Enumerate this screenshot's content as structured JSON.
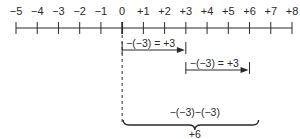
{
  "number_line": {
    "min": -5,
    "max": 8,
    "tick_labels": [
      "−5",
      "−4",
      "−3",
      "−2",
      "−1",
      "0",
      "+1",
      "+2",
      "+3",
      "+4",
      "+5",
      "+6",
      "+7",
      "+8"
    ]
  },
  "arrows": [
    {
      "from": 0,
      "to": 3,
      "label": "−(−3) = +3"
    },
    {
      "from": 3,
      "to": 6,
      "label": "−(−3) = +3"
    }
  ],
  "brace": {
    "from": 0,
    "to": 6,
    "label_top": "−(−3)−(−3)",
    "label_bottom": "+6"
  },
  "colors": {
    "ink": "#2a2a2a"
  }
}
